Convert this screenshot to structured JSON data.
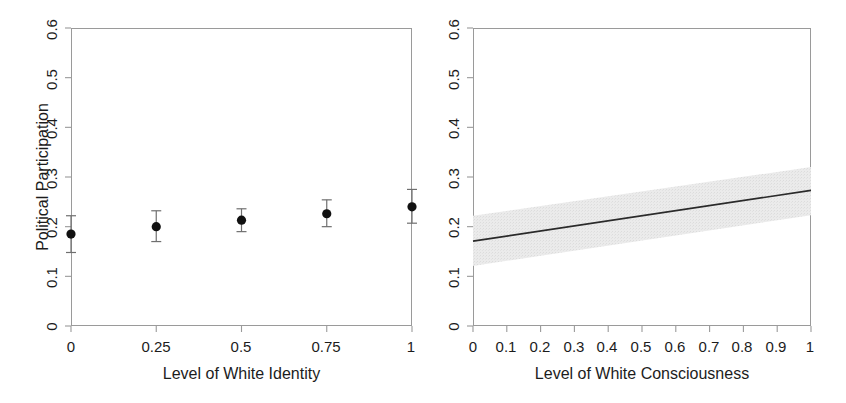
{
  "figure": {
    "panel_count": 2,
    "background_color": "#ffffff",
    "frame_color": "#9a9a9a",
    "ink_color": "#1c1c1c",
    "band_color": "#e6e6e6"
  },
  "panels": [
    {
      "id": "left",
      "ylabel": "Political Participation",
      "xlabel": "Level of White Identity",
      "yticks": [
        "0",
        "0.1",
        "0.2",
        "0.3",
        "0.4",
        "0.5",
        "0.6"
      ],
      "xticks": [
        "0",
        "0.25",
        "0.5",
        "0.75",
        "1"
      ]
    },
    {
      "id": "right",
      "ylabel": "",
      "xlabel": "Level of White Consciousness",
      "yticks": [
        "0",
        "0.1",
        "0.2",
        "0.3",
        "0.4",
        "0.5",
        "0.6"
      ],
      "xticks": [
        "0",
        "0.1",
        "0.2",
        "0.3",
        "0.4",
        "0.5",
        "0.6",
        "0.7",
        "0.8",
        "0.9",
        "1"
      ]
    }
  ],
  "chart_data": [
    {
      "type": "scatter",
      "panel": "left",
      "title": "",
      "xlabel": "Level of White Identity",
      "ylabel": "Political Participation",
      "xlim": [
        0,
        1
      ],
      "ylim": [
        0,
        0.6
      ],
      "ytick_values": [
        0,
        0.1,
        0.2,
        0.3,
        0.4,
        0.5,
        0.6
      ],
      "xtick_values": [
        0,
        0.25,
        0.5,
        0.75,
        1
      ],
      "grid": false,
      "legend": "none",
      "marker": "filled-circle",
      "error_bars": "vertical-with-caps",
      "x": [
        0,
        0.25,
        0.5,
        0.75,
        1
      ],
      "values": [
        0.185,
        0.2,
        0.213,
        0.226,
        0.24
      ],
      "ci_low": [
        0.148,
        0.17,
        0.19,
        0.2,
        0.207
      ],
      "ci_high": [
        0.222,
        0.232,
        0.236,
        0.254,
        0.275
      ],
      "annotations": []
    },
    {
      "type": "line",
      "panel": "right",
      "title": "",
      "xlabel": "Level of White Consciousness",
      "ylabel": "",
      "xlim": [
        0,
        1
      ],
      "ylim": [
        0,
        0.6
      ],
      "ytick_values": [
        0,
        0.1,
        0.2,
        0.3,
        0.4,
        0.5,
        0.6
      ],
      "xtick_values": [
        0,
        0.1,
        0.2,
        0.3,
        0.4,
        0.5,
        0.6,
        0.7,
        0.8,
        0.9,
        1
      ],
      "grid": false,
      "legend": "none",
      "band": "shaded-confidence-interval",
      "x": [
        0,
        1
      ],
      "values": [
        0.171,
        0.273
      ],
      "ci_low": [
        0.121,
        0.223
      ],
      "ci_high": [
        0.222,
        0.32
      ],
      "annotations": []
    }
  ]
}
